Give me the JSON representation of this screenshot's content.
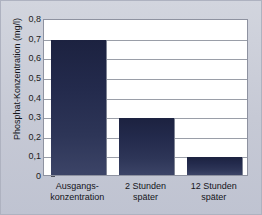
{
  "chart_data": {
    "type": "bar",
    "title": "",
    "xlabel": "",
    "ylabel": "Phosphat-Konzentration (mg/l)",
    "categories": [
      "Ausgangs-konzentration",
      "2 Stunden später",
      "12 Stunden später"
    ],
    "category_lines": [
      [
        "Ausgangs-",
        "konzentration"
      ],
      [
        "2 Stunden",
        "später"
      ],
      [
        "12 Stunden",
        "später"
      ]
    ],
    "values": [
      0.69,
      0.29,
      0.09
    ],
    "ylim": [
      0,
      0.8
    ],
    "ytick_values": [
      0.8,
      0.7,
      0.6,
      0.5,
      0.4,
      0.3,
      0.2,
      0.1,
      0
    ],
    "ytick_labels": [
      "0,8",
      "0,7",
      "0,6",
      "0,5",
      "0,4",
      "0,3",
      "0,2",
      "0,1",
      "0"
    ],
    "grid": true,
    "legend": "none",
    "bar_color": "#232a4c",
    "plot_background": "#ffffff",
    "panel_background": "#c9ccd8",
    "gridline_color": "#9a9ea8"
  }
}
